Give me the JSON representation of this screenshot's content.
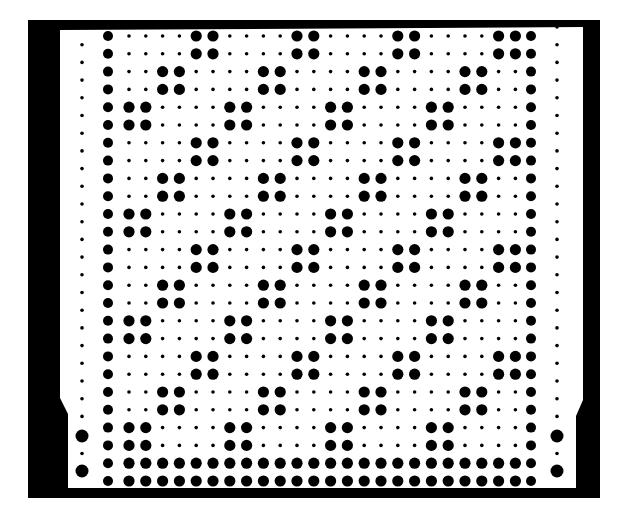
{
  "figure": {
    "kind": "punched-card",
    "colors": {
      "background": "#ffffff",
      "ink": "#000000",
      "card": "#ffffff"
    }
  },
  "frame": {
    "top_bar": {
      "x": 28,
      "y": 20,
      "w": 572,
      "h": 9
    },
    "bottom_bar": {
      "x": 28,
      "y": 488,
      "w": 572,
      "h": 10
    },
    "left_band": {
      "x": 28,
      "y": 20,
      "w": 32,
      "h": 478
    },
    "right_band": {
      "x": 583,
      "y": 20,
      "w": 17,
      "h": 478
    }
  },
  "grid": {
    "rows": 26,
    "row_y0": 36,
    "row_step": 17.8,
    "border_left_x": 108,
    "border_right_x": 531,
    "interior_cols": 24,
    "interior_x0": 129,
    "interior_step": 16.8,
    "big_r": 5.6,
    "small_r": 1.8,
    "border_r": 5.0
  },
  "pattern": {
    "row_types": [
      "A",
      "A",
      "B",
      "B",
      "C",
      "C",
      "A",
      "A",
      "B",
      "B",
      "C",
      "C",
      "A",
      "A",
      "B",
      "B",
      "C",
      "C",
      "A",
      "A",
      "B",
      "B",
      "C",
      "C",
      "F",
      "F"
    ],
    "types": {
      "A": [
        4,
        5,
        10,
        11,
        16,
        17,
        22,
        23
      ],
      "B": [
        2,
        3,
        8,
        9,
        14,
        15,
        20,
        21
      ],
      "C": [
        0,
        1,
        6,
        7,
        12,
        13,
        18,
        19
      ],
      "F": [
        0,
        1,
        2,
        3,
        4,
        5,
        6,
        7,
        8,
        9,
        10,
        11,
        12,
        13,
        14,
        15,
        16,
        17,
        18,
        19,
        20,
        21,
        22,
        23
      ]
    }
  },
  "outer_holes": {
    "left_x": 82,
    "right_x": 557,
    "y0": 27,
    "step": 17.7,
    "count": 24,
    "small_r": 1.8,
    "big_r": 6.5,
    "big_y": [
      436,
      471
    ]
  }
}
